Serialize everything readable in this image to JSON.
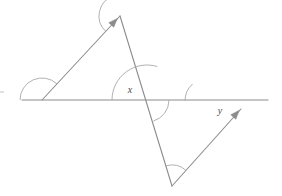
{
  "diagram": {
    "type": "geometry-figure",
    "canvas": {
      "width": 282,
      "height": 196,
      "background": "#ffffff"
    },
    "stroke": {
      "color": "#8c8c8c",
      "width": 1.1,
      "arc_color": "#a8a8a8",
      "arc_width": 0.9
    },
    "labels": {
      "angle_x": "x",
      "angle_y": "y"
    },
    "label_color": "#4a4a4a",
    "points": {
      "line_left_end": {
        "x": 22,
        "y": 100
      },
      "left_vertex": {
        "x": 42,
        "y": 100
      },
      "apex": {
        "x": 120,
        "y": 16
      },
      "crossing": {
        "x": 147,
        "y": 100
      },
      "bottom_vertex": {
        "x": 172,
        "y": 186
      },
      "y_vertex": {
        "x": 208,
        "y": 101
      },
      "ray_arrow_end": {
        "x": 241,
        "y": 109
      },
      "line_right_end": {
        "x": 268,
        "y": 100
      },
      "left_tick": {
        "x": 2,
        "y": 92
      }
    },
    "segments": [
      {
        "name": "horizontal-transversal-line",
        "x1": 22,
        "y1": 100,
        "x2": 268,
        "y2": 100
      },
      {
        "name": "upper-left-ray",
        "x1": 42,
        "y1": 100,
        "x2": 120,
        "y2": 16
      },
      {
        "name": "long-transversal-line",
        "x1": 120,
        "y1": 16,
        "x2": 172,
        "y2": 186
      },
      {
        "name": "lower-right-ray",
        "x1": 172,
        "y1": 186,
        "x2": 241,
        "y2": 109
      }
    ],
    "arrowheads": [
      {
        "name": "upper-left-ray-arrowhead",
        "x": 114,
        "y": 22,
        "angle": -47
      },
      {
        "name": "lower-right-ray-arrowhead",
        "x": 236,
        "y": 114,
        "angle": -48
      }
    ],
    "angle_arcs": [
      {
        "name": "left-vertex-angle-arc",
        "cx": 42,
        "cy": 100,
        "r": 22,
        "start_deg": 180,
        "end_deg": 313
      },
      {
        "name": "apex-angle-arc",
        "cx": 120,
        "cy": 16,
        "r": 21,
        "start_deg": 133,
        "end_deg": 253
      },
      {
        "name": "angle-x-arc",
        "cx": 147,
        "cy": 100,
        "r": 35,
        "start_deg": 180,
        "end_deg": 287
      },
      {
        "name": "crossing-lower-angle-arc",
        "cx": 147,
        "cy": 100,
        "r": 22,
        "start_deg": 0,
        "end_deg": 73
      },
      {
        "name": "angle-y-arc",
        "cx": 208,
        "cy": 101,
        "r": 23,
        "start_deg": 180,
        "end_deg": 228
      },
      {
        "name": "bottom-vertex-angle-arc",
        "cx": 172,
        "cy": 186,
        "r": 21,
        "start_deg": 253,
        "end_deg": 312
      }
    ],
    "label_positions": {
      "angle_x": {
        "x": 130,
        "y": 93
      },
      "angle_y": {
        "x": 220,
        "y": 114
      }
    }
  }
}
